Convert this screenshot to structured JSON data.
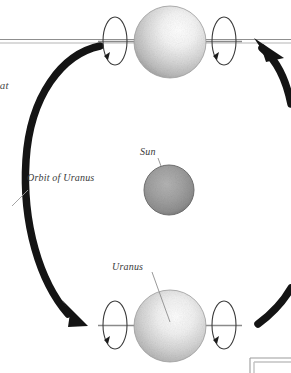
{
  "figure": {
    "background_color": "#ffffff",
    "labels": {
      "orbit": "Orbit of Uranus",
      "sun": "Sun",
      "uranus": "Uranus",
      "clipped_text_top_left": "hat",
      "clipped_text_bottom_left": "y"
    },
    "colors": {
      "orbit_line": "#111111",
      "axis_line": "#8c8c8c",
      "leader_line": "#9a9a9a",
      "planet_rim": "#9e9e9e",
      "planet_highlight": "#ffffff",
      "planet_body": "#cfcfcf",
      "sun_body": "#9c9c9c",
      "sun_rim": "#6f6f6f",
      "rotation_arrow": "#2a2a2a",
      "label_text": "#3a3a3a",
      "frame_line": "#a8a8a8"
    },
    "elements": {
      "planet_top": "Uranus at top of orbit with rotation axis horizontal",
      "planet_bottom": "Uranus at bottom of orbit with rotation axis horizontal",
      "sun": "Sun at center of orbit",
      "orbit_arc_left": "thick orbit arc on left side with arrowhead pointing down-right",
      "orbit_arc_right": "thick orbit arc on right side with arrowhead pointing up-left",
      "axis_line_top": "double horizontal axis line through top planet",
      "rotation_ellipse": "open ellipse with small arrowhead showing spin direction",
      "corner_frame": "partial rectangular frame at bottom right"
    }
  }
}
